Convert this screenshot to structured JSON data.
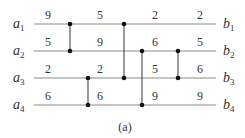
{
  "diagram": {
    "type": "sorting-network",
    "caption": "(a)",
    "inputs": [
      {
        "name": "a",
        "sub": "1"
      },
      {
        "name": "a",
        "sub": "2"
      },
      {
        "name": "a",
        "sub": "3"
      },
      {
        "name": "a",
        "sub": "4"
      }
    ],
    "outputs": [
      {
        "name": "b",
        "sub": "1"
      },
      {
        "name": "b",
        "sub": "2"
      },
      {
        "name": "b",
        "sub": "3"
      },
      {
        "name": "b",
        "sub": "4"
      }
    ],
    "stage_values": [
      [
        "9",
        "5",
        "2",
        "3",
        "6"
      ],
      [
        "5",
        "9",
        "6",
        "5",
        "5"
      ],
      [
        "2",
        "2",
        "5",
        "6"
      ],
      [
        "6",
        "6",
        "9",
        "9"
      ]
    ],
    "wire_values": {
      "wire1": [
        "9",
        "5",
        "2",
        "2"
      ],
      "wire2": [
        "5",
        "9",
        "6",
        "5"
      ],
      "wire3": [
        "2",
        "2",
        "5",
        "6"
      ],
      "wire4": [
        "6",
        "6",
        "9",
        "9"
      ]
    },
    "comparators": [
      {
        "from": 1,
        "to": 2
      },
      {
        "from": 3,
        "to": 4
      },
      {
        "from": 1,
        "to": 3
      },
      {
        "from": 2,
        "to": 4
      },
      {
        "from": 2,
        "to": 3
      }
    ],
    "colors": {
      "wire": "#888888",
      "comparator": "#333333",
      "node": "#111111"
    }
  }
}
